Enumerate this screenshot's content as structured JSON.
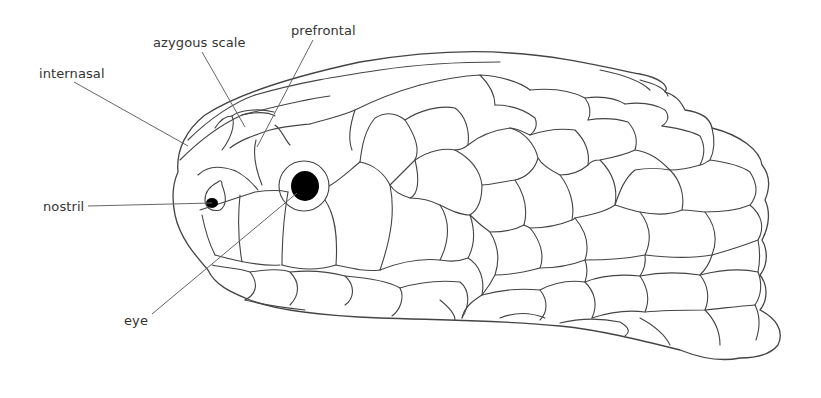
{
  "diagram": {
    "labels": [
      {
        "id": "internasal",
        "text": "internasal",
        "x": 39,
        "y": 66
      },
      {
        "id": "azygous",
        "text": "azygous scale",
        "x": 153,
        "y": 35
      },
      {
        "id": "prefrontal",
        "text": "prefrontal",
        "x": 291,
        "y": 23
      },
      {
        "id": "nostril",
        "text": "nostril",
        "x": 43,
        "y": 200
      },
      {
        "id": "eye",
        "text": "eye",
        "x": 124,
        "y": 313
      }
    ],
    "colors": {
      "line": "#444444",
      "leader": "#666666",
      "text": "#333333",
      "pupil": "#000000",
      "background": "#ffffff"
    }
  }
}
